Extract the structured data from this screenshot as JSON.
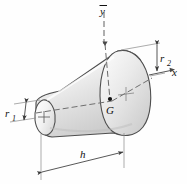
{
  "figure": {
    "name": "truncated-cone-frustum-centroid-diagram",
    "background_color": "#fefefe",
    "body_fill_light": "#fdfdfd",
    "body_fill_mid": "#e2e2e2",
    "body_fill_dark": "#b9b9b9",
    "outline_color": "#4a4a4a",
    "axis_color": "#555555",
    "dimension_color": "#3a3a3a"
  },
  "labels": {
    "y_axis": "y",
    "y_axis_overbar": "̅",
    "x_axis": "x",
    "centroid": "G",
    "radius_small": "r",
    "radius_small_sub": "1",
    "radius_large": "r",
    "radius_large_sub": "2",
    "height": "h"
  },
  "geometry": {
    "apex_top_point": [
      107,
      42
    ],
    "centroid_point": [
      111,
      101
    ],
    "small_face_center": [
      43,
      118
    ],
    "large_face_center": [
      133,
      94
    ],
    "small_radius_px": 17,
    "large_radius_px": 46,
    "axial_length_px": 92
  }
}
